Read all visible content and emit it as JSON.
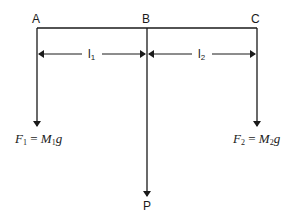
{
  "diagram": {
    "points": {
      "a": "A",
      "b": "B",
      "c": "C",
      "p": "P"
    },
    "lengths": {
      "l1": {
        "base": "l",
        "sub": "1"
      },
      "l2": {
        "base": "l",
        "sub": "2"
      }
    },
    "forces": {
      "f1": {
        "F": "F",
        "fsub": "1",
        "eq": "=",
        "M": "M",
        "msub": "1",
        "g": "g"
      },
      "f2": {
        "F": "F",
        "fsub": "2",
        "eq": "=",
        "M": "M",
        "msub": "2",
        "g": "g"
      }
    },
    "colors": {
      "line": "#1a1a1a",
      "background": "#ffffff"
    }
  }
}
